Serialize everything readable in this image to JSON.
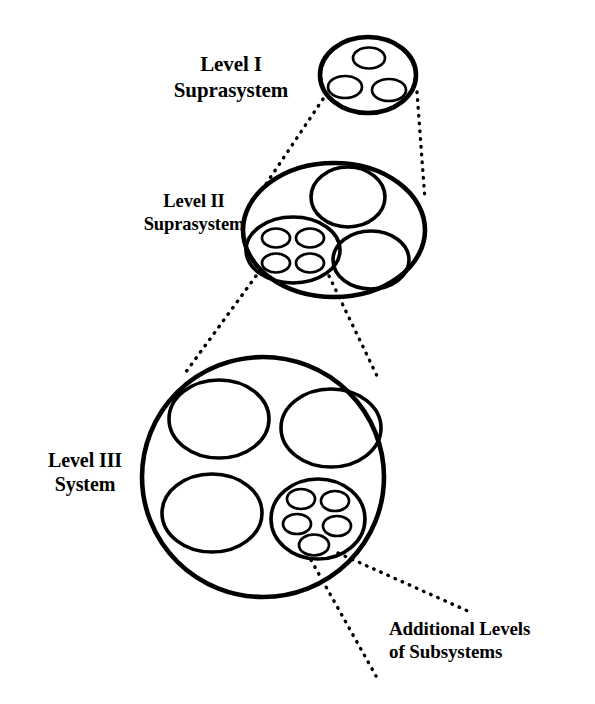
{
  "diagram": {
    "background_color": "#ffffff",
    "stroke_color": "#000000",
    "labels": {
      "level_1": {
        "line1": "Level I",
        "line2": "Suprasystem"
      },
      "level_2": {
        "line1": "Level II",
        "line2": "Suprasystem"
      },
      "level_3": {
        "line1": "Level III",
        "line2": "System"
      },
      "additional": {
        "line1": "Additional Levels",
        "line2": "of Subsystems"
      }
    },
    "levels": [
      {
        "id": "level-1",
        "name": "Level I Suprasystem",
        "subsystem_count": 3,
        "nested_cluster_count": 0
      },
      {
        "id": "level-2",
        "name": "Level II Suprasystem",
        "subsystem_count": 3,
        "nested_cluster_count": 1,
        "nested_subsystem_count": 4
      },
      {
        "id": "level-3",
        "name": "Level III System",
        "subsystem_count": 4,
        "nested_cluster_count": 1,
        "nested_subsystem_count": 5
      }
    ],
    "connector_count": 6,
    "connector_style": "dotted"
  }
}
